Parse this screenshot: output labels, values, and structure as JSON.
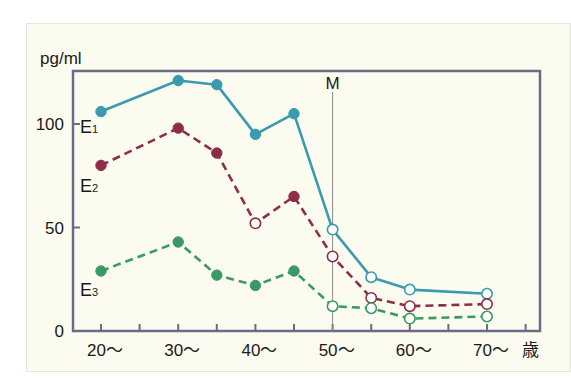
{
  "chart_data": {
    "type": "line",
    "title": "",
    "ylabel": "pg/ml",
    "xlabel": "歳",
    "ylim": [
      0,
      125
    ],
    "yticks": [
      0,
      50,
      100
    ],
    "x_tick_labels": [
      "20～",
      "30～",
      "40～",
      "50～",
      "60～",
      "70～"
    ],
    "x": [
      20,
      30,
      35,
      40,
      45,
      50,
      55,
      60,
      70
    ],
    "grid": false,
    "annotations": [
      {
        "label": "M",
        "x": 50,
        "type": "vertical-line"
      }
    ],
    "series": [
      {
        "name": "E1",
        "label_main": "E",
        "label_sub": "1",
        "color": "#3a9ab0",
        "style": "solid",
        "values": [
          106,
          121,
          119,
          95,
          105,
          49,
          26,
          20,
          18
        ],
        "hollow_from_index": 5
      },
      {
        "name": "E2",
        "label_main": "E",
        "label_sub": "2",
        "color": "#8e2d4a",
        "style": "dashed",
        "values": [
          80,
          98,
          86,
          52,
          65,
          36,
          16,
          12,
          13
        ],
        "hollow_indices": [
          3,
          5,
          6,
          7,
          8
        ]
      },
      {
        "name": "E3",
        "label_main": "E",
        "label_sub": "3",
        "color": "#3a9a63",
        "style": "dashed",
        "values": [
          29,
          43,
          27,
          22,
          29,
          12,
          11,
          6,
          7
        ],
        "hollow_from_index": 5
      }
    ]
  },
  "axis": {
    "y_unit": "pg/ml",
    "x_unit": "歳",
    "marker_label": "M"
  }
}
